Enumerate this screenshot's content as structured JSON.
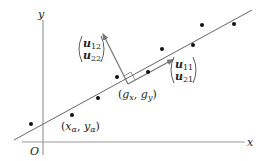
{
  "diagram": {
    "title": "",
    "axes": {
      "x_label": "x",
      "y_label": "y",
      "origin_label": "O"
    },
    "regression_line": {
      "from": [
        14,
        140
      ],
      "to": [
        252,
        10
      ],
      "color": "#666666"
    },
    "points": [
      [
        31,
        124
      ],
      [
        72,
        115
      ],
      [
        98,
        98
      ],
      [
        117,
        77
      ],
      [
        148,
        72
      ],
      [
        162,
        49
      ],
      [
        193,
        45
      ],
      [
        202,
        25
      ],
      [
        234,
        24
      ]
    ],
    "centroid_label": {
      "open": "(",
      "g": "g",
      "x_sub": "x",
      "comma": ", ",
      "g2": "g",
      "y_sub": "y",
      "close": ")"
    },
    "sample_label": {
      "open": "(",
      "x": "x",
      "alpha_sub": "α",
      "comma": ", ",
      "y": "y",
      "alpha_sub2": "α",
      "close": ")"
    },
    "principal_vector_label": {
      "top": "u",
      "top_sub": "11",
      "bottom": "u",
      "bottom_sub": "21"
    },
    "normal_vector_label": {
      "top": "u",
      "top_sub": "12",
      "bottom": "u",
      "bottom_sub": "22"
    },
    "colors": {
      "axis": "#999999",
      "line": "#666666",
      "arrow": "#777777",
      "point": "#111111",
      "text": "#222222"
    }
  }
}
